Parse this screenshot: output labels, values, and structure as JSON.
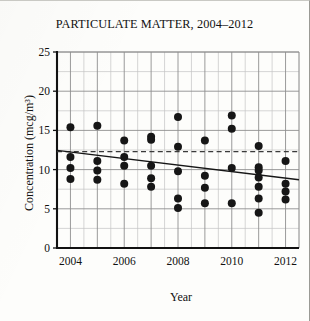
{
  "figure": {
    "title": "PARTICULATE MATTER, 2004–2012",
    "border_color": "#9a9a95",
    "background": "#fdfdfb"
  },
  "axes": {
    "y_title": "Concentration (mcg/m³)",
    "x_title": "Year",
    "y_ticks": [
      "0",
      "5",
      "10",
      "15",
      "20",
      "25"
    ],
    "x_ticks": [
      "2004",
      "2006",
      "2008",
      "2010",
      "2012"
    ]
  },
  "chart_data": {
    "type": "scatter",
    "title": "PARTICULATE MATTER, 2004–2012",
    "xlabel": "Year",
    "ylabel": "Concentration (mcg/m³)",
    "xlim": [
      2003.5,
      2012.5
    ],
    "ylim": [
      0,
      25
    ],
    "x_ticks": [
      2004,
      2006,
      2008,
      2010,
      2012
    ],
    "y_ticks": [
      0,
      5,
      10,
      15,
      20,
      25
    ],
    "y_minor_step": 2.5,
    "x_minor_step": 0.5,
    "grid": true,
    "legend": "none",
    "marker": {
      "shape": "circle",
      "color": "#161616",
      "size": 5.2
    },
    "points": [
      {
        "x": 2004,
        "y": 15.4
      },
      {
        "x": 2004,
        "y": 11.6
      },
      {
        "x": 2004,
        "y": 10.2
      },
      {
        "x": 2004,
        "y": 8.8
      },
      {
        "x": 2005,
        "y": 15.6
      },
      {
        "x": 2005,
        "y": 11.1
      },
      {
        "x": 2005,
        "y": 9.9
      },
      {
        "x": 2005,
        "y": 8.7
      },
      {
        "x": 2006,
        "y": 13.7
      },
      {
        "x": 2006,
        "y": 11.6
      },
      {
        "x": 2006,
        "y": 10.5
      },
      {
        "x": 2006,
        "y": 8.2
      },
      {
        "x": 2007,
        "y": 14.2
      },
      {
        "x": 2007,
        "y": 13.8
      },
      {
        "x": 2007,
        "y": 10.5
      },
      {
        "x": 2007,
        "y": 8.9
      },
      {
        "x": 2007,
        "y": 7.8
      },
      {
        "x": 2008,
        "y": 16.7
      },
      {
        "x": 2008,
        "y": 12.9
      },
      {
        "x": 2008,
        "y": 9.8
      },
      {
        "x": 2008,
        "y": 6.3
      },
      {
        "x": 2008,
        "y": 5.1
      },
      {
        "x": 2009,
        "y": 13.7
      },
      {
        "x": 2009,
        "y": 9.2
      },
      {
        "x": 2009,
        "y": 7.7
      },
      {
        "x": 2009,
        "y": 5.7
      },
      {
        "x": 2010,
        "y": 16.9
      },
      {
        "x": 2010,
        "y": 15.2
      },
      {
        "x": 2010,
        "y": 10.2
      },
      {
        "x": 2010,
        "y": 5.7
      },
      {
        "x": 2011,
        "y": 13.0
      },
      {
        "x": 2011,
        "y": 10.3
      },
      {
        "x": 2011,
        "y": 9.9
      },
      {
        "x": 2011,
        "y": 9.0
      },
      {
        "x": 2011,
        "y": 7.8
      },
      {
        "x": 2011,
        "y": 6.3
      },
      {
        "x": 2011,
        "y": 4.5
      },
      {
        "x": 2012,
        "y": 11.1
      },
      {
        "x": 2012,
        "y": 8.2
      },
      {
        "x": 2012,
        "y": 7.2
      },
      {
        "x": 2012,
        "y": 6.2
      }
    ],
    "reference_line": {
      "style": "dashed",
      "color": "#3a3a3a",
      "y": 12.3,
      "label": "mean reference"
    },
    "trend_line": {
      "style": "solid",
      "color": "#161616",
      "x_start": 2003.5,
      "y_start": 12.45,
      "x_end": 2012.5,
      "y_end": 8.7,
      "label": "linear trend"
    }
  }
}
